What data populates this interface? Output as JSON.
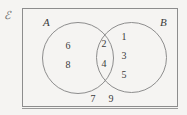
{
  "diagram": {
    "type": "venn",
    "universe": {
      "symbol": "ℰ",
      "symbol_name": "script-capital-e",
      "meaning": "universal set"
    },
    "sets": [
      {
        "id": "A",
        "label": "A"
      },
      {
        "id": "B",
        "label": "B"
      }
    ],
    "regions": {
      "a_only": {
        "name": "A only",
        "elements": [
          "6",
          "8"
        ]
      },
      "intersection": {
        "name": "A intersect B",
        "elements": [
          "2",
          "4"
        ]
      },
      "b_only": {
        "name": "B only",
        "elements": [
          "1",
          "3",
          "5"
        ]
      },
      "outside": {
        "name": "outside both sets",
        "elements": [
          "7",
          "9"
        ]
      }
    },
    "colors": {
      "background": "#f5f4f2",
      "stroke": "#8d8d8d",
      "text": "#3b3b3b",
      "symbol": "#6b6b6b"
    }
  }
}
